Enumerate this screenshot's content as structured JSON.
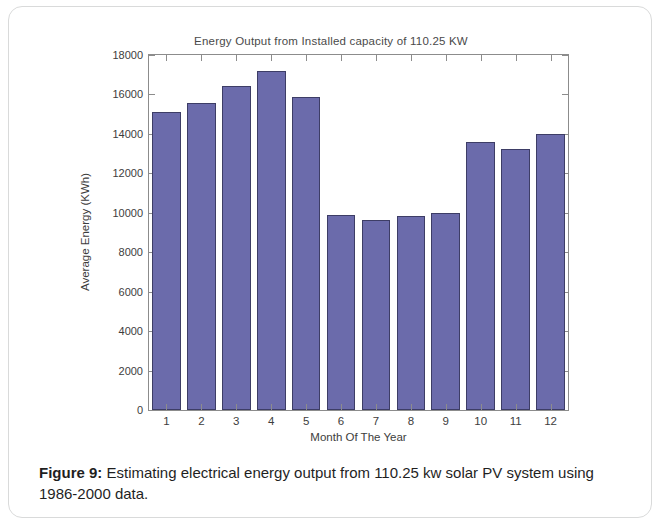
{
  "figure": {
    "title": "Energy Output from Installed capacity of 110.25 KW",
    "caption_label": "Figure 9:",
    "caption_text": " Estimating electrical energy output from 110.25 kw solar PV system using 1986-2000 data.",
    "bar_color": "#6b6bab",
    "bar_edge_color": "#3d3d66",
    "axis_color": "#8c8c8c"
  },
  "chart_data": {
    "type": "bar",
    "title": "Energy Output from Installed capacity of 110.25 KW",
    "xlabel": "Month Of The Year",
    "ylabel": "Average Energy (KWh)",
    "categories": [
      "1",
      "2",
      "3",
      "4",
      "5",
      "6",
      "7",
      "8",
      "9",
      "10",
      "11",
      "12"
    ],
    "values": [
      15100,
      15550,
      16450,
      17200,
      15850,
      9900,
      9650,
      9850,
      10000,
      13600,
      13250,
      14000
    ],
    "ylim": [
      0,
      18000
    ],
    "yticks": [
      0,
      2000,
      4000,
      6000,
      8000,
      10000,
      12000,
      14000,
      16000,
      18000
    ],
    "ytick_labels": [
      "0",
      "2000",
      "4000",
      "6000",
      "8000",
      "10000",
      "12000",
      "14000",
      "16000",
      "18000"
    ],
    "grid": false,
    "legend": null,
    "box": true
  }
}
